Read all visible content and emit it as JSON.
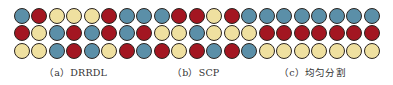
{
  "colors": {
    "B": "#5b8fa8",
    "R": "#a31621",
    "Y": "#efe0a0",
    "outline": "#2a2420"
  },
  "grid": {
    "columns": 21,
    "rows": 3,
    "start_x": 13.5,
    "start_y": 7.5,
    "pitch_x": 17.5,
    "pitch_y": 17.5,
    "cells": [
      [
        "B",
        "R",
        "Y",
        "Y",
        "Y",
        "R",
        "B",
        "B",
        "B",
        "R",
        "R",
        "Y",
        "R",
        "B",
        "B",
        "B",
        "B",
        "B",
        "B",
        "B",
        "B"
      ],
      [
        "R",
        "Y",
        "B",
        "R",
        "B",
        "R",
        "B",
        "R",
        "Y",
        "Y",
        "B",
        "Y",
        "Y",
        "Y",
        "R",
        "R",
        "R",
        "R",
        "R",
        "R",
        "R"
      ],
      [
        "Y",
        "Y",
        "B",
        "R",
        "B",
        "Y",
        "R",
        "B",
        "R",
        "Y",
        "R",
        "B",
        "R",
        "B",
        "Y",
        "Y",
        "Y",
        "Y",
        "Y",
        "Y",
        "Y"
      ]
    ]
  },
  "panels": [
    {
      "id": "a",
      "label": "（a）DRRDL",
      "x": 44
    },
    {
      "id": "b",
      "label": "（b）SCP",
      "x": 172
    },
    {
      "id": "c",
      "label": "（c）均匀分割",
      "x": 279
    }
  ]
}
